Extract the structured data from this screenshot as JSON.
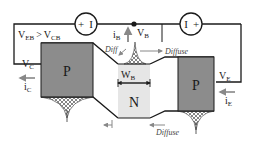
{
  "diagram": {
    "regions": {
      "collector": "P",
      "base": "N",
      "emitter": "P"
    },
    "labels": {
      "veb_main": "V",
      "veb_sub": "EB",
      "gt": ">",
      "vcb_main": "V",
      "vcb_sub": "CB",
      "vc_main": "V",
      "vc_sub": "C",
      "ic_main": "i",
      "ic_sub": "C",
      "ib_main": "i",
      "ib_sub": "B",
      "vb_main": "V",
      "vb_sub": "B",
      "wb_main": "W",
      "wb_sub": "B",
      "ve_main": "V",
      "ve_sub": "E",
      "ie_main": "i",
      "ie_sub": "E",
      "diff": "Diff",
      "diffuse_top": "Diffuse",
      "diffuse_bottom": "Diffuse"
    },
    "sources": {
      "left_plus": "+",
      "left_minus": "I",
      "right_minus": "I",
      "right_plus": "+"
    },
    "colors": {
      "p_region": "#8c8c8c",
      "n_region": "#e6e6e6",
      "line": "#1a1a1a",
      "arrow": "#888888"
    }
  }
}
